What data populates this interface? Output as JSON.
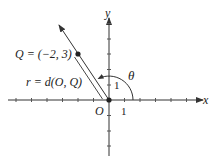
{
  "diagram": {
    "type": "polar-coordinates",
    "axes": {
      "x_label": "x",
      "y_label": "y",
      "origin_label": "O",
      "x_unit_label": "1",
      "y_unit_label": "1"
    },
    "point": {
      "label": "Q = (−2, 3)",
      "x": -2,
      "y": 3
    },
    "distance_label": "r = d(O, Q)",
    "angle_label": "θ",
    "colors": {
      "stroke": "#333333",
      "text": "#222222",
      "background": "#ffffff"
    }
  }
}
